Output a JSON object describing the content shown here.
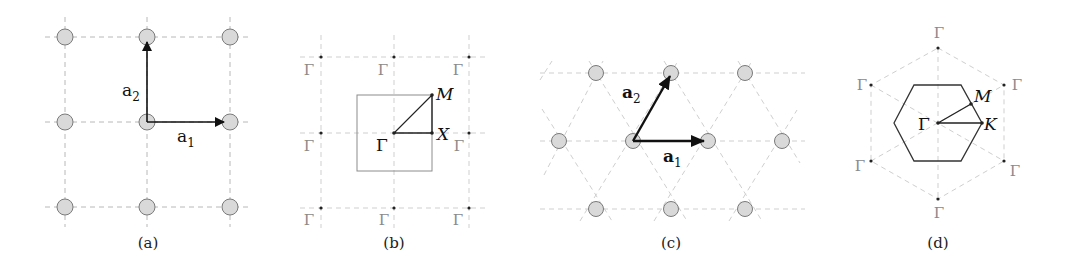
{
  "figure": {
    "panels": [
      {
        "id": "a",
        "caption": "(a)",
        "type": "square real-space lattice",
        "vector_labels": {
          "a1": "a",
          "a1_sub": "1",
          "a2": "a",
          "a2_sub": "2"
        }
      },
      {
        "id": "b",
        "caption": "(b)",
        "type": "square reciprocal lattice / Brillouin zone",
        "point_labels": {
          "gamma": "Γ",
          "m": "M",
          "x": "X"
        },
        "outer_gamma_label": "Γ"
      },
      {
        "id": "c",
        "caption": "(c)",
        "type": "triangular real-space lattice",
        "vector_labels": {
          "a1": "a",
          "a1_sub": "1",
          "a2": "a",
          "a2_sub": "2"
        }
      },
      {
        "id": "d",
        "caption": "(d)",
        "type": "hexagonal Brillouin zone",
        "point_labels": {
          "gamma": "Γ",
          "m": "M",
          "k": "K"
        },
        "outer_gamma_label": "Γ"
      }
    ]
  }
}
